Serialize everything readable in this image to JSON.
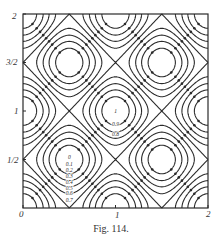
{
  "figure": {
    "caption": "Fig. 114."
  },
  "chart_data": {
    "type": "contour",
    "title": "",
    "caption": "Fig. 114.",
    "xlabel": "",
    "ylabel": "",
    "xlim": [
      0,
      2
    ],
    "ylim": [
      0,
      2
    ],
    "x_ticks": [
      {
        "value": 0,
        "label": "0"
      },
      {
        "value": 1,
        "label": "1"
      },
      {
        "value": 2,
        "label": "2"
      }
    ],
    "y_ticks": [
      {
        "value": 0.5,
        "label": "1/2"
      },
      {
        "value": 1,
        "label": "1"
      },
      {
        "value": 1.5,
        "label": "3/2"
      },
      {
        "value": 2,
        "label": "2"
      }
    ],
    "function_estimate": "f(x,y) = (cos^2(pi x) + cos^2(pi y)) / 2",
    "contour_levels": [
      0.1,
      0.2,
      0.3,
      0.4,
      0.5,
      0.6,
      0.7,
      0.8,
      0.9
    ],
    "minima": [
      {
        "x": 0.5,
        "y": 0.5,
        "value": 0
      },
      {
        "x": 1.5,
        "y": 0.5,
        "value": 0
      },
      {
        "x": 0.5,
        "y": 1.5,
        "value": 0
      },
      {
        "x": 1.5,
        "y": 1.5,
        "value": 0
      }
    ],
    "maxima": [
      {
        "x": 1,
        "y": 1,
        "value": 1
      },
      {
        "x": 0,
        "y": 0,
        "value": 1
      },
      {
        "x": 2,
        "y": 0,
        "value": 1
      },
      {
        "x": 0,
        "y": 2,
        "value": 1
      },
      {
        "x": 2,
        "y": 2,
        "value": 1
      },
      {
        "x": 0,
        "y": 1,
        "value": 1
      },
      {
        "x": 2,
        "y": 1,
        "value": 1
      },
      {
        "x": 1,
        "y": 0,
        "value": 1
      },
      {
        "x": 1,
        "y": 2,
        "value": 1
      }
    ],
    "annotations": [
      {
        "x": 1.0,
        "y": 1.0,
        "text": "1"
      },
      {
        "x": 1.0,
        "y": 0.87,
        "text": "0.9"
      },
      {
        "x": 1.0,
        "y": 0.76,
        "text": "0.8"
      },
      {
        "x": 0.5,
        "y": 0.53,
        "text": "0"
      },
      {
        "x": 0.5,
        "y": 0.45,
        "text": "0.1"
      },
      {
        "x": 0.5,
        "y": 0.39,
        "text": "0.2"
      },
      {
        "x": 0.5,
        "y": 0.33,
        "text": "0.3"
      },
      {
        "x": 0.5,
        "y": 0.27,
        "text": "0.4"
      },
      {
        "x": 0.5,
        "y": 0.21,
        "text": "0.5"
      },
      {
        "x": 0.5,
        "y": 0.15,
        "text": "0.6"
      },
      {
        "x": 0.5,
        "y": 0.08,
        "text": "0.7"
      }
    ],
    "markers": "dots on each contour along diagonals through minima",
    "grid": false,
    "legend": null,
    "colors": {
      "line": "#2a2a2a",
      "background": "#ffffff"
    }
  }
}
